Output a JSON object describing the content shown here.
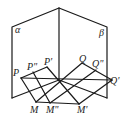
{
  "diagram": {
    "planes": [
      {
        "name": "alpha",
        "label": "α"
      },
      {
        "name": "beta",
        "label": "β"
      }
    ],
    "points": {
      "P": "P",
      "P2": "P\"",
      "P1": "P'",
      "Q": "Q",
      "Q2": "Q\"",
      "Q1": "Q'",
      "M": "M",
      "M2": "M\"",
      "M1": "M'"
    },
    "colors": {
      "stroke": "#1a1a1a",
      "background": "#ffffff"
    }
  }
}
